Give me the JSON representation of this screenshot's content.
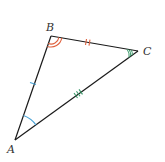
{
  "diagram": {
    "type": "triangle",
    "vertices": [
      {
        "label": "A",
        "x": 15,
        "y": 140,
        "label_x": 7,
        "label_y": 153
      },
      {
        "label": "B",
        "x": 51,
        "y": 36,
        "label_x": 46,
        "label_y": 31
      },
      {
        "label": "C",
        "x": 138,
        "y": 51,
        "label_x": 143,
        "label_y": 55
      }
    ],
    "angle_marks": [
      {
        "vertex": "A",
        "arcs": 1,
        "color": "#4aa3d6"
      },
      {
        "vertex": "B",
        "arcs": 2,
        "color": "#e0613e"
      },
      {
        "vertex": "C",
        "arcs": 3,
        "color": "#3a9a6a"
      }
    ],
    "side_marks": [
      {
        "side": "AB",
        "ticks": 1,
        "color": "#4aa3d6"
      },
      {
        "side": "BC",
        "ticks": 2,
        "color": "#e0613e"
      },
      {
        "side": "AC",
        "ticks": 3,
        "color": "#3a9a6a"
      }
    ],
    "line_color": "#1a1a1a"
  }
}
